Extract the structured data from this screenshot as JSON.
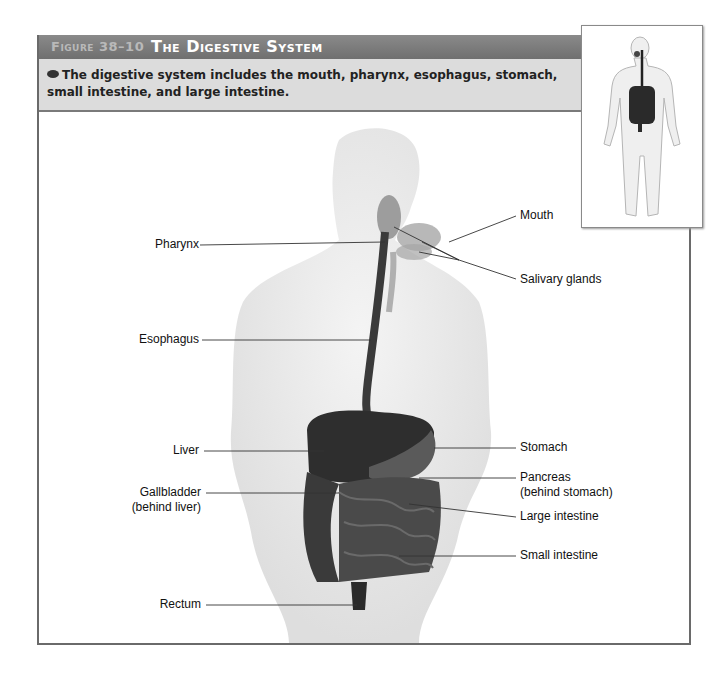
{
  "figure": {
    "number": "Figure 38–10",
    "title": "The Digestive System",
    "caption": "The digestive system includes the mouth, pharynx, esophagus, stomach, small intestine, and large intestine.",
    "colors": {
      "header": "#7a7a7a",
      "caption_bg": "#dcdcdc",
      "border": "#6a6a6a",
      "organs": "#2e2e2e",
      "body_silhouette": "#e6e6e6"
    }
  },
  "labels": {
    "left": [
      {
        "text": "Pharynx"
      },
      {
        "text": "Esophagus"
      },
      {
        "text": "Liver"
      },
      {
        "text": "Gallbladder",
        "sub": "(behind liver)"
      },
      {
        "text": "Rectum"
      }
    ],
    "right": [
      {
        "text": "Mouth"
      },
      {
        "text": "Salivary glands"
      },
      {
        "text": "Stomach"
      },
      {
        "text": "Pancreas",
        "sub": "(behind stomach)"
      },
      {
        "text": "Large intestine"
      },
      {
        "text": "Small intestine"
      }
    ]
  },
  "inset": {
    "description": "full-body locator figure showing digestive system"
  }
}
